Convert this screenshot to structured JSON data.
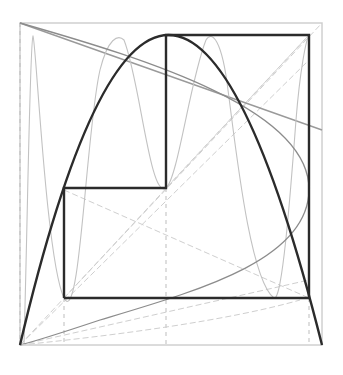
{
  "diagram": {
    "type": "cobweb-plot",
    "frame": {
      "x0": 20,
      "y0": 23,
      "x1": 322,
      "y1": 345
    },
    "colors": {
      "background": "#ffffff",
      "bold": "#2b2b2b",
      "medium": "#8a8a8a",
      "faint": "#c4c4c4",
      "frame": "#cfcfcf"
    },
    "parabola": {
      "start": [
        20,
        345
      ],
      "peak": [
        166,
        35
      ],
      "end": [
        322,
        345
      ]
    },
    "orbit_path": [
      [
        64,
        298
      ],
      [
        64,
        188
      ],
      [
        166,
        188
      ],
      [
        166,
        35
      ],
      [
        309,
        35
      ],
      [
        309,
        298
      ],
      [
        64,
        298
      ]
    ],
    "dashed_guides_x": [
      64,
      166,
      309
    ],
    "labels": []
  }
}
